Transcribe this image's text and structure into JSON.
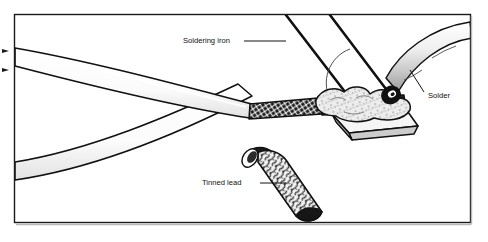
{
  "figure": {
    "type": "technical-line-illustration",
    "frame": {
      "stroke_color": "#1a1a1a",
      "fill_color": "#ffffff"
    },
    "palette": {
      "outline": "#111111",
      "white": "#ffffff",
      "cable_fill": "#fdfdfd",
      "shading_light": "#e9e9e9",
      "shading_mid": "#c9c9c9",
      "shading_dark": "#8a8a8a",
      "braid_dark": "#1a1a1a",
      "solder_blob": "#efefef",
      "tip_face": "#f4f4f4",
      "tip_side": "#cfcfcf"
    },
    "labels": [
      {
        "id": "soldering-iron",
        "text": "Soldering iron",
        "x": 183,
        "y": 41,
        "anchor": "start",
        "leader": true
      },
      {
        "id": "solder",
        "text": "Solder",
        "x": 428,
        "y": 96,
        "anchor": "start",
        "leader": true
      },
      {
        "id": "tinned-lead",
        "text": "Tinned lead",
        "x": 202,
        "y": 183,
        "anchor": "start",
        "leader": true
      }
    ],
    "parts": [
      {
        "id": "outer-cable-upper",
        "name": "Insulated cable (upper, foreground)"
      },
      {
        "id": "outer-cable-lower",
        "name": "Insulated cable (lower, crossing)"
      },
      {
        "id": "shield-braid",
        "name": "Exposed braided shield"
      },
      {
        "id": "tinned-lead-body",
        "name": "Tinned lead (mottled solder coating)"
      },
      {
        "id": "solder-wire",
        "name": "Solder wire entering from upper right"
      },
      {
        "id": "soldering-iron-shaft",
        "name": "Soldering iron shaft"
      },
      {
        "id": "soldering-iron-tip",
        "name": "Chisel soldering iron tip"
      },
      {
        "id": "molten-solder-blob",
        "name": "Molten solder fillet on joint"
      }
    ]
  }
}
